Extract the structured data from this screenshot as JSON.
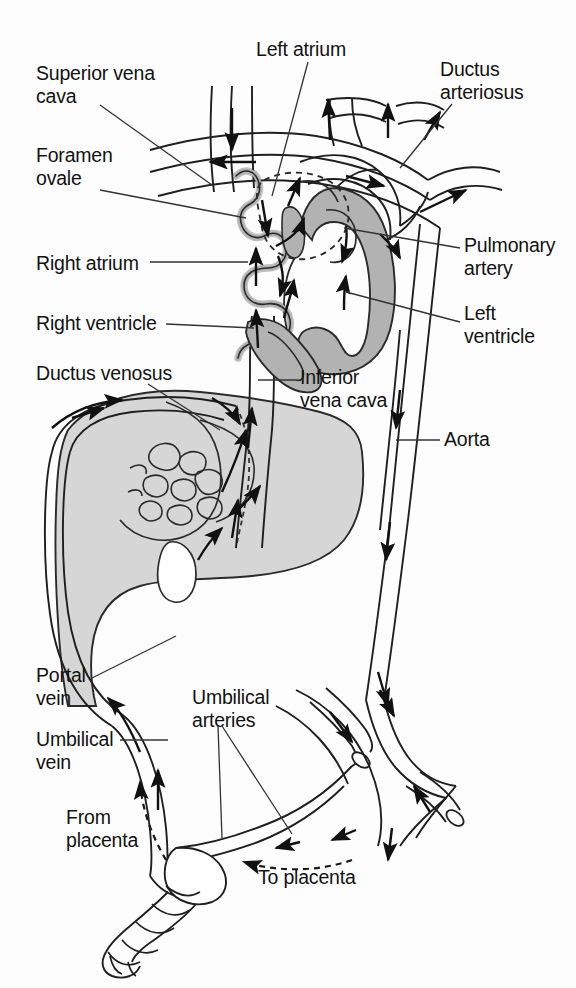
{
  "figure": {
    "domain": "anatomical-diagram",
    "colors": {
      "background": "#fdfdfd",
      "outline": "#1a1a1a",
      "myocardium_gray": "#b2b2b2",
      "liver_gray": "#d6d6d6",
      "leader_line": "#2b2b2b",
      "arrow_fill": "#111111"
    }
  },
  "labels": [
    {
      "id": "superior-vena-cava",
      "text": "Superior vena\ncava",
      "x": 36,
      "y": 62,
      "align": "left"
    },
    {
      "id": "left-atrium",
      "text": "Left atrium",
      "x": 256,
      "y": 38,
      "align": "left"
    },
    {
      "id": "ductus-arteriosus",
      "text": "Ductus\narteriosus",
      "x": 440,
      "y": 58,
      "align": "left"
    },
    {
      "id": "foramen-ovale",
      "text": "Foramen\novale",
      "x": 36,
      "y": 144,
      "align": "left"
    },
    {
      "id": "right-atrium",
      "text": "Right atrium",
      "x": 36,
      "y": 252,
      "align": "left"
    },
    {
      "id": "pulmonary-artery",
      "text": "Pulmonary\nartery",
      "x": 464,
      "y": 234,
      "align": "left"
    },
    {
      "id": "left-ventricle",
      "text": "Left\nventricle",
      "x": 464,
      "y": 302,
      "align": "left"
    },
    {
      "id": "right-ventricle",
      "text": "Right ventricle",
      "x": 36,
      "y": 312,
      "align": "left"
    },
    {
      "id": "ductus-venosus",
      "text": "Ductus venosus",
      "x": 36,
      "y": 362,
      "align": "left"
    },
    {
      "id": "inferior-vena-cava",
      "text": "Inferior\nvena cava",
      "x": 300,
      "y": 366,
      "align": "left"
    },
    {
      "id": "aorta",
      "text": "Aorta",
      "x": 444,
      "y": 428,
      "align": "left"
    },
    {
      "id": "portal-vein",
      "text": "Portal\nvein",
      "x": 36,
      "y": 664,
      "align": "left"
    },
    {
      "id": "umbilical-arteries",
      "text": "Umbilical\narteries",
      "x": 192,
      "y": 686,
      "align": "left"
    },
    {
      "id": "umbilical-vein",
      "text": "Umbilical\nvein",
      "x": 36,
      "y": 728,
      "align": "left"
    },
    {
      "id": "from-placenta",
      "text": "From\nplacenta",
      "x": 66,
      "y": 806,
      "align": "left"
    },
    {
      "id": "to-placenta",
      "text": "To placenta",
      "x": 258,
      "y": 866,
      "align": "left"
    }
  ],
  "structures": [
    {
      "id": "heart",
      "name": "Fetal heart",
      "fill": "myocardium_gray"
    },
    {
      "id": "liver",
      "name": "Liver",
      "fill": "liver_gray"
    },
    {
      "id": "umbilical-cord",
      "name": "Umbilical cord",
      "fill": "none"
    },
    {
      "id": "aorta-vessel",
      "name": "Descending aorta",
      "fill": "none"
    },
    {
      "id": "iliac-vessels",
      "name": "Iliac vessels",
      "fill": "none"
    }
  ],
  "flow_arrows": {
    "count": 30,
    "solid_description": "blood flow direction within vessels and heart chambers",
    "dashed_description": "flow to and from the placenta"
  }
}
